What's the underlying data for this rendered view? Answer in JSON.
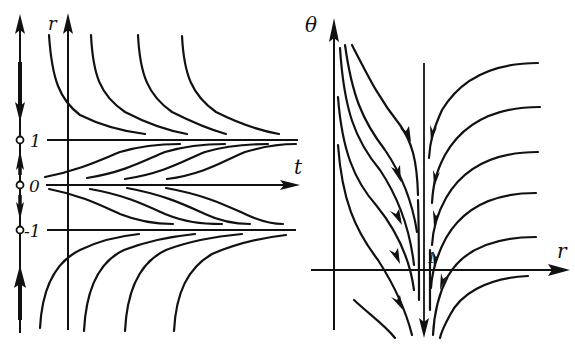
{
  "figure": {
    "left_panel": {
      "description": "Solution curves r(t) with phase line",
      "axes": {
        "vertical_label": "r",
        "horizontal_label": "t"
      },
      "phase_line": {
        "equilibria": [
          {
            "label": "1",
            "value": 1,
            "stability": "stable"
          },
          {
            "label": "0",
            "value": 0,
            "stability": "unstable"
          },
          {
            "label": "-1",
            "value": -1,
            "stability": "stable"
          }
        ],
        "arrows": [
          "up (r>1, toward +inf)",
          "down (r>1, toward 1)",
          "up (0<r<1, toward 1)",
          "down (-1<r<0, toward -1)",
          "up (r<-1, toward -1)"
        ]
      },
      "equilibrium_lines": [
        "r = 1",
        "r = 0",
        "r = -1"
      ]
    },
    "right_panel": {
      "description": "Phase portrait in (r, theta) plane",
      "axes": {
        "vertical_label": "θ",
        "horizontal_label": "r"
      },
      "marker_label": "1",
      "vertical_line": "r = 1 with downward flow"
    }
  },
  "labels": {
    "r_left": "r",
    "t": "t",
    "one": "1",
    "zero": "0",
    "minus_one": "-1",
    "theta": "θ",
    "r_right": "r",
    "one_right": "1"
  },
  "colors": {
    "ink": "#111111",
    "paper": "#ffffff"
  }
}
